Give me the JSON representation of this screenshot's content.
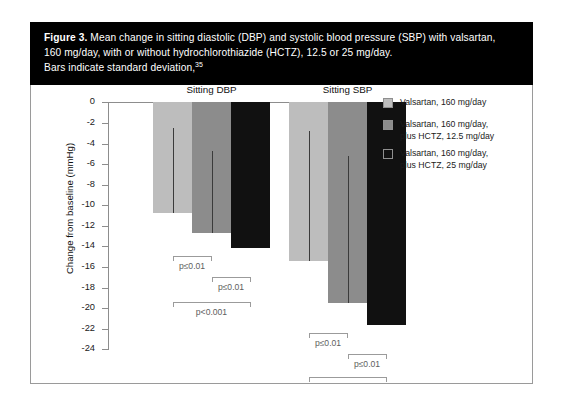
{
  "caption": {
    "figure_label": "Figure 3.",
    "line1": " Mean change in sitting diastolic (DBP) and systolic blood pressure (SBP) with valsartan,",
    "line2": "160 mg/day, with or without hydrochlorothiazide (HCTZ), 12.5 or 25 mg/day.",
    "line3": "Bars indicate standard deviation,",
    "reference": "35"
  },
  "colors": {
    "series1": "#bdbdbd",
    "series2": "#8c8c8c",
    "series3": "#111111",
    "banner": "#000000",
    "axis": "#8d8d8d",
    "bracket": "#9b9b9b",
    "bracket_text": "#5e5e5e"
  },
  "chart_data": {
    "type": "bar",
    "title": "",
    "xlabel": "",
    "ylabel": "Change from baseline (mmHg)",
    "ylim": [
      -24,
      0
    ],
    "yticks": [
      "0",
      "-2",
      "-4",
      "-6",
      "-8",
      "-10",
      "-12",
      "-14",
      "-16",
      "-18",
      "-20",
      "-22",
      "-24"
    ],
    "ytick_values": [
      0,
      -2,
      -4,
      -6,
      -8,
      -10,
      -12,
      -14,
      -16,
      -18,
      -20,
      -22,
      -24
    ],
    "grid": false,
    "legend_position": "right",
    "categories": [
      "Sitting DBP",
      "Sitting SBP"
    ],
    "series": [
      {
        "name": "Valsartan, 160 mg/day",
        "color": "#bdbdbd",
        "values": [
          -10.7,
          -15.4
        ],
        "sd_top": [
          -2.5,
          -2.8
        ]
      },
      {
        "name": "Valsartan, 160 mg/day, plus HCTZ, 12.5 mg/day",
        "color": "#8c8c8c",
        "values": [
          -12.7,
          -19.5
        ],
        "sd_top": [
          -4.7,
          -5.2
        ]
      },
      {
        "name": "Valsartan, 160 mg/day, plus HCTZ, 25 mg/day",
        "color": "#111111",
        "values": [
          -14.1,
          -21.6
        ],
        "sd_top": [
          null,
          null
        ]
      }
    ],
    "annotations": [
      {
        "group": "Sitting DBP",
        "from": 0,
        "to": 1,
        "label": "p≤0.01",
        "y": -14.9
      },
      {
        "group": "Sitting DBP",
        "from": 1,
        "to": 2,
        "label": "p≤0.01",
        "y": -17.0
      },
      {
        "group": "Sitting DBP",
        "from": 0,
        "to": 2,
        "label": "p<0.001",
        "y": -19.4
      },
      {
        "group": "Sitting SBP",
        "from": 0,
        "to": 1,
        "label": "p≤0.01",
        "y": -22.4
      },
      {
        "group": "Sitting SBP",
        "from": 1,
        "to": 2,
        "label": "p≤0.01",
        "y": -24.4
      },
      {
        "group": "Sitting SBP",
        "from": 0,
        "to": 2,
        "label": "p<0.001",
        "y": -26.7
      }
    ]
  },
  "legend": {
    "items": [
      {
        "swatch": "#bdbdbd",
        "lines": [
          "Valsartan, 160 mg/day"
        ]
      },
      {
        "swatch": "#8c8c8c",
        "lines": [
          "Valsartan, 160 mg/day,",
          "plus HCTZ, 12.5 mg/day"
        ]
      },
      {
        "swatch": "#111111",
        "lines": [
          "Valsartan, 160 mg/day,",
          "plus HCTZ, 25 mg/day"
        ]
      }
    ]
  }
}
